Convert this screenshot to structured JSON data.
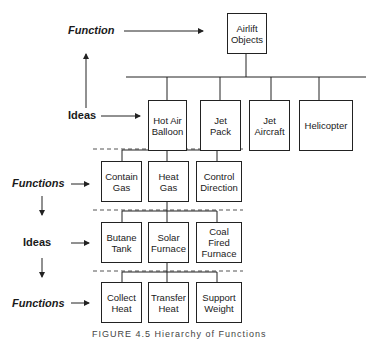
{
  "diagram": {
    "top_level": {
      "label": "Function",
      "box": "Airlift\nObjects"
    },
    "ideas_level": {
      "label": "Ideas",
      "boxes": [
        "Hot Air\nBalloon",
        "Jet\nPack",
        "Jet\nAircraft",
        "Helicopter"
      ]
    },
    "functions_level_1": {
      "label": "Functions",
      "boxes": [
        "Contain\nGas",
        "Heat\nGas",
        "Control\nDirection"
      ]
    },
    "ideas_level_2": {
      "label": "Ideas",
      "boxes": [
        "Butane\nTank",
        "Solar\nFurnace",
        "Coal\nFired\nFurnace"
      ]
    },
    "functions_level_2": {
      "label": "Functions",
      "boxes": [
        "Collect\nHeat",
        "Transfer\nHeat",
        "Support\nWeight"
      ]
    },
    "caption": "FIGURE 4.5 Hierarchy of Functions"
  }
}
